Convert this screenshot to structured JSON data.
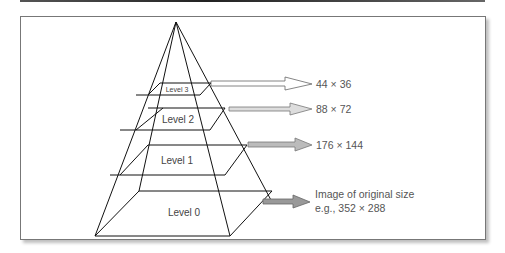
{
  "diagram": {
    "levels": [
      {
        "label": "Level 3",
        "size": "44 × 36"
      },
      {
        "label": "Level 2",
        "size": "88 × 72"
      },
      {
        "label": "Level 1",
        "size": "176 × 144"
      },
      {
        "label": "Level 0",
        "size_line1": "Image of original size",
        "size_line2": "e.g., 352 × 288"
      }
    ]
  }
}
